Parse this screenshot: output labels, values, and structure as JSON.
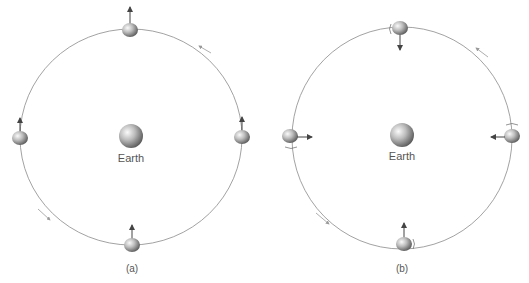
{
  "figure": {
    "panels": [
      {
        "id": "a",
        "caption": "(a)",
        "center_label": "Earth",
        "description": "Moon orbiting Earth without rotation: the arrow on the Moon always points in the same direction (up)"
      },
      {
        "id": "b",
        "caption": "(b)",
        "center_label": "Earth",
        "description": "Moon in synchronous rotation: the arrow on the Moon always points toward Earth"
      }
    ],
    "colors": {
      "orbit": "#8a8a8a",
      "arrow": "#444444",
      "label": "#555555"
    }
  }
}
